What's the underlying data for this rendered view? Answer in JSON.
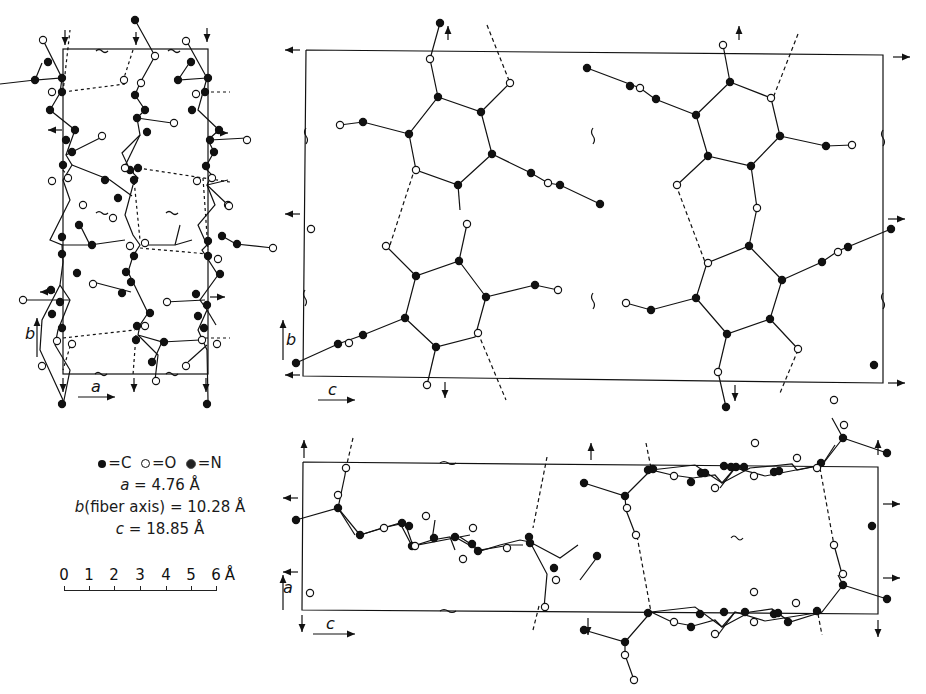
{
  "figure": {
    "panels": [
      {
        "id": "ab-projection",
        "axes": [
          "a",
          "b"
        ],
        "description": "Projection along c"
      },
      {
        "id": "bc-projection",
        "axes": [
          "c",
          "b"
        ],
        "description": "Projection along a"
      },
      {
        "id": "ac-projection",
        "axes": [
          "c",
          "a"
        ],
        "description": "Projection along b (fiber axis)"
      }
    ],
    "axis_labels": {
      "a": "a",
      "b": "b",
      "c": "c"
    }
  },
  "legend": {
    "atoms": [
      {
        "symbol": "filled-dot",
        "label": "=C"
      },
      {
        "symbol": "open-circle",
        "label": "=O"
      },
      {
        "symbol": "dotted-dot",
        "label": "=N"
      }
    ],
    "cell": {
      "a_label": "a",
      "a_value": "= 4.76 Å",
      "b_label": "b",
      "b_value": "(fiber axis) = 10.28 Å",
      "c_label": "c",
      "c_value": "= 18.85 Å"
    }
  },
  "scale_bar": {
    "ticks": [
      "0",
      "1",
      "2",
      "3",
      "4",
      "5",
      "6"
    ],
    "unit": "Å"
  },
  "colors": {
    "ink": "#111111",
    "background": "#ffffff"
  }
}
